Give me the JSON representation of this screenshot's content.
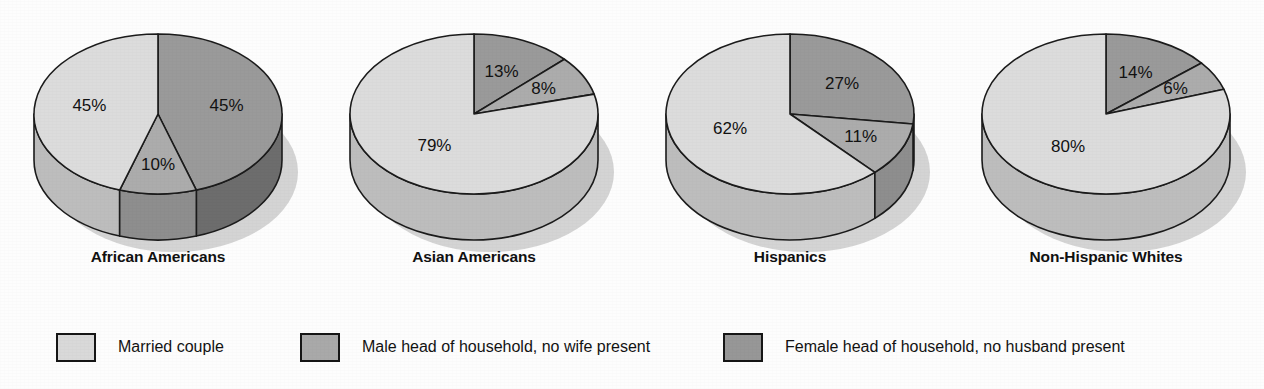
{
  "chart_data": {
    "type": "pie",
    "title": "",
    "subtitle": "",
    "xlabel": "",
    "ylabel": "",
    "grid": false,
    "legend_position": "bottom",
    "unit": "%",
    "legend": [
      {
        "label": "Married couple",
        "color": "#d9d9d9",
        "key": "married"
      },
      {
        "label": "Male head of household, no wife present",
        "color": "#a9a9a9",
        "key": "male_head"
      },
      {
        "label": "Female head of household, no husband present",
        "color": "#979797",
        "key": "female_head"
      }
    ],
    "categories": [
      "African Americans",
      "Asian Americans",
      "Hispanics",
      "Non-Hispanic Whites"
    ],
    "series": [
      {
        "name": "Married couple",
        "values": [
          45,
          79,
          62,
          80
        ]
      },
      {
        "name": "Male head of household, no wife present",
        "values": [
          10,
          8,
          11,
          6
        ]
      },
      {
        "name": "Female head of household, no husband present",
        "values": [
          45,
          13,
          27,
          14
        ]
      }
    ],
    "pies": [
      {
        "label": "African Americans",
        "slices": [
          {
            "key": "female_head",
            "value": 45,
            "label": "45%"
          },
          {
            "key": "male_head",
            "value": 10,
            "label": "10%"
          },
          {
            "key": "married",
            "value": 45,
            "label": "45%"
          }
        ]
      },
      {
        "label": "Asian Americans",
        "slices": [
          {
            "key": "female_head",
            "value": 13,
            "label": "13%"
          },
          {
            "key": "male_head",
            "value": 8,
            "label": "8%"
          },
          {
            "key": "married",
            "value": 79,
            "label": "79%"
          }
        ]
      },
      {
        "label": "Hispanics",
        "slices": [
          {
            "key": "female_head",
            "value": 27,
            "label": "27%"
          },
          {
            "key": "male_head",
            "value": 11,
            "label": "11%"
          },
          {
            "key": "married",
            "value": 62,
            "label": "62%"
          }
        ]
      },
      {
        "label": "Non-Hispanic Whites",
        "slices": [
          {
            "key": "female_head",
            "value": 14,
            "label": "14%"
          },
          {
            "key": "male_head",
            "value": 6,
            "label": "6%"
          },
          {
            "key": "married",
            "value": 80,
            "label": "80%"
          }
        ]
      }
    ]
  },
  "colors": {
    "married_top": "#dcdcdc",
    "married_side": "#bdbdbd",
    "male_head_top": "#acacac",
    "male_head_side": "#8e8e8e",
    "female_head_top": "#9a9a9a",
    "female_head_side": "#6d6d6d",
    "outline": "#1b1b1b",
    "background": "#fdfdfd",
    "shadow": "#c6c6c6",
    "text": "#121212"
  },
  "captions": {
    "pie_0": "African Americans",
    "pie_1": "Asian Americans",
    "pie_2": "Hispanics",
    "pie_3": "Non-Hispanic Whites"
  },
  "legend_labels": {
    "item_0": "Married couple",
    "item_1": "Male head of household, no wife present",
    "item_2": "Female head of household, no husband present"
  }
}
